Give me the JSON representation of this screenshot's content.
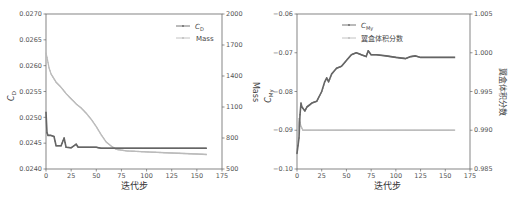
{
  "chart_data": [
    {
      "type": "line",
      "title": "",
      "xlabel": "迭代步",
      "ylabel": "C_D",
      "ylabel_right": "Mass",
      "xlim": [
        0,
        175
      ],
      "ylim": [
        0.024,
        0.027
      ],
      "ylim_right": [
        500,
        2000
      ],
      "x_ticks": [
        "0",
        "25",
        "50",
        "75",
        "100",
        "125",
        "150",
        "175"
      ],
      "y_ticks": [
        "0.0240",
        "0.0245",
        "0.0250",
        "0.0255",
        "0.0260",
        "0.0265",
        "0.0270"
      ],
      "y_ticks_right": [
        "500",
        "800",
        "1100",
        "1400",
        "1700",
        "2000"
      ],
      "legend": [
        "C_D",
        "Mass"
      ],
      "legend_position": "upper right",
      "grid": false,
      "series": [
        {
          "name": "C_D",
          "axis": "left",
          "color": "#666666",
          "x": [
            0,
            1,
            2,
            5,
            8,
            10,
            15,
            18,
            20,
            25,
            30,
            32,
            40,
            50,
            55,
            60,
            70,
            80,
            100,
            125,
            150,
            160
          ],
          "y": [
            0.0251,
            0.0247,
            0.02465,
            0.02465,
            0.02463,
            0.02445,
            0.02445,
            0.0246,
            0.02442,
            0.02441,
            0.02448,
            0.02442,
            0.02442,
            0.02442,
            0.0244,
            0.0244,
            0.0244,
            0.0244,
            0.0244,
            0.0244,
            0.0244,
            0.0244
          ]
        },
        {
          "name": "Mass",
          "axis": "right",
          "color": "#bbbbbb",
          "x": [
            0,
            1,
            3,
            5,
            10,
            15,
            20,
            25,
            30,
            35,
            40,
            45,
            50,
            55,
            60,
            65,
            70,
            80,
            100,
            125,
            150,
            160
          ],
          "y": [
            1620,
            1580,
            1480,
            1420,
            1340,
            1290,
            1230,
            1180,
            1130,
            1090,
            1040,
            980,
            910,
            830,
            760,
            720,
            690,
            675,
            665,
            655,
            645,
            640
          ]
        }
      ]
    },
    {
      "type": "line",
      "title": "",
      "xlabel": "迭代步",
      "ylabel": "C_My",
      "ylabel_right": "翼盒体积分数",
      "xlim": [
        0,
        175
      ],
      "ylim": [
        -0.1,
        -0.06
      ],
      "ylim_right": [
        0.985,
        1.005
      ],
      "x_ticks": [
        "0",
        "25",
        "50",
        "75",
        "100",
        "125",
        "150",
        "175"
      ],
      "y_ticks": [
        "−0.10",
        "−0.09",
        "−0.08",
        "−0.07",
        "−0.06"
      ],
      "y_ticks_right": [
        "0.985",
        "0.990",
        "0.995",
        "1.000",
        "1.005"
      ],
      "legend": [
        "C_My",
        "翼盒体积分数"
      ],
      "legend_position": "upper center",
      "grid": false,
      "series": [
        {
          "name": "C_My",
          "axis": "left",
          "color": "#666666",
          "x": [
            0,
            1,
            2,
            3,
            4,
            5,
            8,
            10,
            15,
            20,
            25,
            28,
            30,
            32,
            35,
            40,
            45,
            50,
            55,
            60,
            65,
            70,
            72,
            75,
            80,
            90,
            100,
            110,
            115,
            120,
            125,
            130,
            140,
            150,
            160
          ],
          "y": [
            -0.096,
            -0.094,
            -0.092,
            -0.086,
            -0.083,
            -0.084,
            -0.085,
            -0.084,
            -0.083,
            -0.0825,
            -0.08,
            -0.0775,
            -0.0765,
            -0.0775,
            -0.0755,
            -0.074,
            -0.0735,
            -0.072,
            -0.0705,
            -0.07,
            -0.0705,
            -0.071,
            -0.0695,
            -0.0705,
            -0.0705,
            -0.0708,
            -0.0712,
            -0.0715,
            -0.071,
            -0.0708,
            -0.0712,
            -0.0712,
            -0.0712,
            -0.0712,
            -0.0712
          ]
        },
        {
          "name": "翼盒体积分数",
          "axis": "right",
          "color": "#bbbbbb",
          "x": [
            0,
            2,
            4,
            6,
            10,
            25,
            50,
            75,
            100,
            125,
            150,
            160
          ],
          "y": [
            0.9885,
            0.9915,
            0.9905,
            0.99,
            0.99,
            0.99,
            0.99,
            0.99,
            0.99,
            0.99,
            0.99,
            0.99
          ]
        }
      ]
    }
  ],
  "figure": {
    "left_panel": {
      "xlabel": "迭代步",
      "ylabel_left_main": "C",
      "ylabel_left_sub": "D",
      "ylabel_right": "Mass",
      "legend_1_main": "C",
      "legend_1_sub": "D",
      "legend_2": "Mass"
    },
    "right_panel": {
      "xlabel": "迭代步",
      "ylabel_left_main": "C",
      "ylabel_left_sub": "My",
      "ylabel_right": "翼盒体积分数",
      "legend_1_main": "C",
      "legend_1_sub": "My",
      "legend_2": "翼盒体积分数"
    },
    "colors": {
      "series_dark": "#666666",
      "series_light": "#bbbbbb",
      "axis": "#666666"
    }
  }
}
